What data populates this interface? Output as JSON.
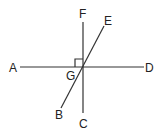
{
  "diagram": {
    "type": "geometry-intersecting-lines",
    "intersection_point": "G",
    "right_angle_marker_at": "G",
    "right_angle_between": [
      "GA",
      "GF"
    ],
    "lines": [
      {
        "name": "line-AD",
        "from": "A",
        "to": "D"
      },
      {
        "name": "line-FC",
        "from": "F",
        "to": "C"
      },
      {
        "name": "line-EB",
        "from": "E",
        "to": "B"
      }
    ],
    "labels": {
      "A": "A",
      "B": "B",
      "C": "C",
      "D": "D",
      "E": "E",
      "F": "F",
      "G": "G"
    },
    "colors": {
      "stroke": "#333333",
      "text": "#222222",
      "background": "#ffffff"
    }
  }
}
